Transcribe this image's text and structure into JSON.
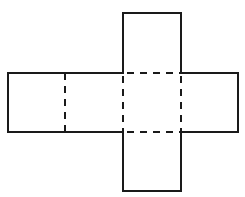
{
  "diagram": {
    "type": "cuboid-net",
    "colors": {
      "stroke": "#1a1a1a",
      "background": "#ffffff"
    },
    "faces": [
      {
        "id": "top-flap",
        "x": 123,
        "y": 13,
        "w": 58,
        "h": 60
      },
      {
        "id": "left-end",
        "x": 8,
        "y": 73,
        "w": 57,
        "h": 59
      },
      {
        "id": "left-middle",
        "x": 65,
        "y": 73,
        "w": 58,
        "h": 59
      },
      {
        "id": "center",
        "x": 123,
        "y": 73,
        "w": 58,
        "h": 59
      },
      {
        "id": "right-end",
        "x": 181,
        "y": 73,
        "w": 57,
        "h": 59
      },
      {
        "id": "bottom-flap",
        "x": 123,
        "y": 132,
        "w": 58,
        "h": 59
      }
    ],
    "fold_lines": [
      {
        "x1": 65,
        "y1": 73,
        "x2": 65,
        "y2": 132
      },
      {
        "x1": 123,
        "y1": 73,
        "x2": 123,
        "y2": 132
      },
      {
        "x1": 181,
        "y1": 73,
        "x2": 181,
        "y2": 132
      },
      {
        "x1": 123,
        "y1": 73,
        "x2": 181,
        "y2": 73
      },
      {
        "x1": 123,
        "y1": 132,
        "x2": 181,
        "y2": 132
      }
    ]
  }
}
